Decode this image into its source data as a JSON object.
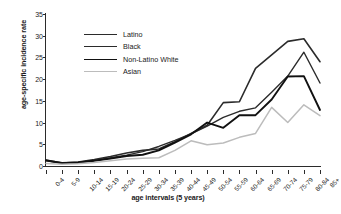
{
  "chart_data": {
    "type": "line",
    "title": "",
    "xlabel": "age intervals (5 years)",
    "ylabel": "age-specific incidence rate",
    "categories": [
      "0-4",
      "5-9",
      "10-14",
      "15-19",
      "20-24",
      "25-29",
      "30-34",
      "35-39",
      "40-44",
      "45-49",
      "50-54",
      "55-59",
      "60-64",
      "65-69",
      "70-74",
      "75-79",
      "80-84",
      "85+"
    ],
    "yticks": [
      0,
      5,
      10,
      15,
      20,
      25,
      30,
      35
    ],
    "ylim": [
      0,
      35
    ],
    "grid": false,
    "legend_position": "upper-left",
    "series": [
      {
        "name": "Latino",
        "color": "#2b2b2b",
        "width": 1.6,
        "values": [
          1.4,
          0.7,
          0.9,
          1.5,
          2.2,
          3.0,
          3.6,
          3.9,
          5.6,
          7.5,
          9.4,
          14.6,
          14.8,
          22.5,
          25.6,
          28.7,
          29.3,
          24.0
        ]
      },
      {
        "name": "Black",
        "color": "#2b2b2b",
        "width": 1.4,
        "values": [
          1.2,
          0.6,
          0.8,
          1.3,
          1.9,
          2.5,
          3.3,
          4.5,
          5.9,
          7.4,
          9.2,
          11.2,
          12.6,
          13.4,
          17.0,
          20.7,
          26.2,
          19.1
        ]
      },
      {
        "name": "Non-Latino White",
        "color": "#111111",
        "width": 1.9,
        "values": [
          1.3,
          0.7,
          0.8,
          1.2,
          1.7,
          2.3,
          2.6,
          3.6,
          5.4,
          7.3,
          10.0,
          8.8,
          11.7,
          11.7,
          15.3,
          20.6,
          20.7,
          12.9
        ]
      },
      {
        "name": "Asian",
        "color": "#bcbcbc",
        "width": 1.5,
        "values": [
          0.6,
          0.4,
          0.5,
          0.8,
          1.2,
          1.6,
          1.8,
          1.9,
          3.6,
          5.8,
          4.9,
          5.3,
          6.6,
          7.5,
          13.5,
          10.0,
          14.1,
          11.6
        ]
      }
    ]
  },
  "legend": {
    "items": [
      {
        "label": "Latino"
      },
      {
        "label": "Black"
      },
      {
        "label": "Non-Latino White"
      },
      {
        "label": "Asian"
      }
    ]
  }
}
